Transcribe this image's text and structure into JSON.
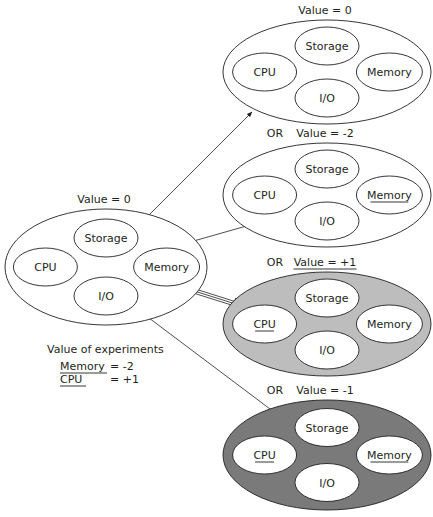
{
  "colors": {
    "stroke": "#231f20",
    "background": "#ffffff",
    "fill_none": "#ffffff",
    "fill_light": "#bdbdbd",
    "fill_dark": "#7a7a7a",
    "inner_fill": "#ffffff"
  },
  "source": {
    "title": "Value = 0",
    "cx": 106,
    "cy": 267,
    "rx": 101,
    "ry": 58,
    "fill": "none",
    "components": [
      {
        "label": "Storage",
        "underline": false,
        "dx": 0,
        "dy": -27
      },
      {
        "label": "CPU",
        "underline": false,
        "dx": -62,
        "dy": 0
      },
      {
        "label": "Memory",
        "underline": false,
        "dx": 46,
        "dy": 0
      },
      {
        "label": "I/O",
        "underline": false,
        "dx": 0,
        "dy": 27
      }
    ]
  },
  "outcomes": [
    {
      "prefix": "",
      "title": "Value = 0",
      "title_underline": false,
      "cx": 327,
      "cy": 72,
      "rx": 104,
      "ry": 52,
      "fill": "none",
      "arrow": {
        "style": "single",
        "from": [
          148,
          216
        ],
        "to": [
          252,
          112
        ]
      },
      "components": [
        {
          "label": "Storage",
          "underline": false
        },
        {
          "label": "CPU",
          "underline": false
        },
        {
          "label": "Memory",
          "underline": false
        },
        {
          "label": "I/O",
          "underline": false
        }
      ]
    },
    {
      "prefix": "OR",
      "title": "Value = -2",
      "title_underline": false,
      "cx": 327,
      "cy": 195,
      "rx": 104,
      "ry": 52,
      "fill": "none",
      "arrow": {
        "style": "single",
        "from": [
          183,
          244
        ],
        "to": [
          250,
          225
        ]
      },
      "components": [
        {
          "label": "Storage",
          "underline": false
        },
        {
          "label": "CPU",
          "underline": false
        },
        {
          "label": "Memory",
          "underline": true
        },
        {
          "label": "I/O",
          "underline": false
        }
      ]
    },
    {
      "prefix": "OR",
      "title": "Value = +1",
      "title_underline": true,
      "cx": 327,
      "cy": 324,
      "rx": 104,
      "ry": 52,
      "fill": "light",
      "arrow": {
        "style": "triple",
        "from": [
          188,
          289
        ],
        "to": [
          245,
          307
        ]
      },
      "components": [
        {
          "label": "Storage",
          "underline": false
        },
        {
          "label": "CPU",
          "underline": true
        },
        {
          "label": "Memory",
          "underline": false
        },
        {
          "label": "I/O",
          "underline": false
        }
      ]
    },
    {
      "prefix": "OR",
      "title": "Value = -1",
      "title_underline": false,
      "cx": 327,
      "cy": 455,
      "rx": 104,
      "ry": 55,
      "fill": "dark",
      "arrow": {
        "style": "single",
        "from": [
          145,
          315
        ],
        "to": [
          282,
          418
        ]
      },
      "components": [
        {
          "label": "Storage",
          "underline": false
        },
        {
          "label": "CPU",
          "underline": true
        },
        {
          "label": "Memory",
          "underline": true
        },
        {
          "label": "I/O",
          "underline": false
        }
      ]
    }
  ],
  "legend": {
    "title": "Value of experiments",
    "rows": [
      {
        "name": "Memory",
        "value": "= -2"
      },
      {
        "name": "CPU",
        "value": "= +1"
      }
    ]
  }
}
